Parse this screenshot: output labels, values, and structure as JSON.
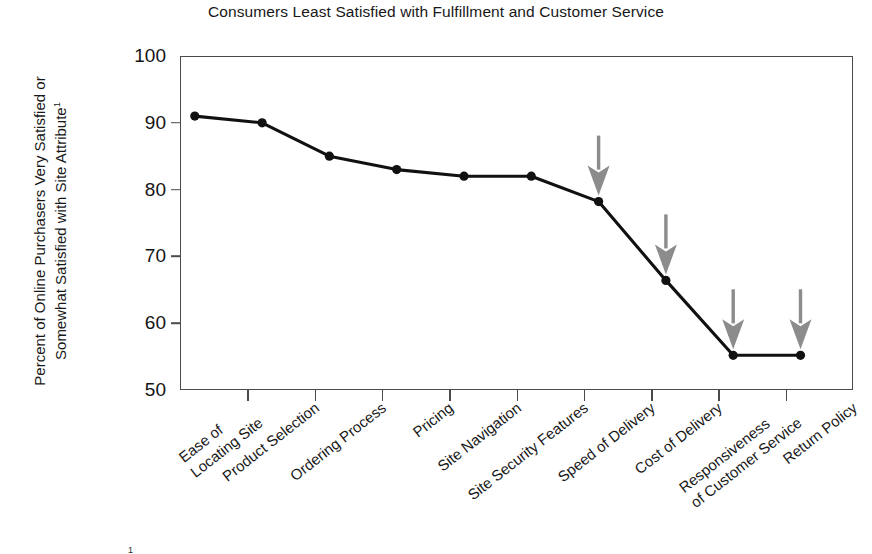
{
  "chart_data": {
    "type": "line",
    "title": "Consumers Least Satisfied with Fulfillment and Customer Service",
    "xlabel": "",
    "ylabel": "Percent of Online Purchasers Very Satisfied or Somewhat Satisfied with Site Attribute",
    "ylabel_line1": "Percent of Online Purchasers Very Satisfied or",
    "ylabel_line2": "Somewhat Satisfied with Site Attribute",
    "ylabel_footnote_marker": "1",
    "ylim": [
      50,
      100
    ],
    "ytick_labels": [
      "100",
      "90",
      "80",
      "70",
      "60",
      "50"
    ],
    "ytick_values": [
      100,
      90,
      80,
      70,
      60,
      50
    ],
    "grid": false,
    "legend": "none",
    "categories": [
      "Ease of\nLocating Site",
      "Product Selection",
      "Ordering Process",
      "Pricing",
      "Site Navigation",
      "Site Security Features",
      "Speed of Delivery",
      "Cost of Delivery",
      "Responsiveness\nof Customer Service",
      "Return Policy"
    ],
    "category_lines": [
      [
        "Ease of",
        "Locating Site"
      ],
      [
        "Product Selection"
      ],
      [
        "Ordering Process"
      ],
      [
        "Pricing"
      ],
      [
        "Site Navigation"
      ],
      [
        "Site Security Features"
      ],
      [
        "Speed of Delivery"
      ],
      [
        "Cost of Delivery"
      ],
      [
        "Responsiveness",
        "of Customer Service"
      ],
      [
        "Return Policy"
      ]
    ],
    "values": [
      91,
      90,
      85,
      83,
      82,
      82,
      78.2,
      66.4,
      55.2,
      55.2
    ],
    "annotations": [
      {
        "type": "arrow",
        "target_category": "Speed of Delivery",
        "target_value": 78.2,
        "color": "#8c8c8c",
        "direction": "down"
      },
      {
        "type": "arrow",
        "target_category": "Cost of Delivery",
        "target_value": 66.4,
        "color": "#8c8c8c",
        "direction": "down"
      },
      {
        "type": "arrow",
        "target_category": "Responsiveness of Customer Service",
        "target_value": 55.2,
        "color": "#8c8c8c",
        "direction": "down"
      },
      {
        "type": "arrow",
        "target_category": "Return Policy",
        "target_value": 55.2,
        "color": "#8c8c8c",
        "direction": "down"
      }
    ],
    "series_color": "#111111",
    "marker": "circle",
    "marker_color": "#111111"
  },
  "footnote": {
    "marker": "1",
    "text": ""
  }
}
